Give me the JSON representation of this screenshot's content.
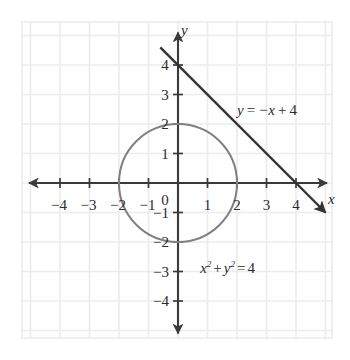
{
  "chart_data": {
    "type": "scatter",
    "title": "",
    "subtitle": "",
    "xlabel": "x",
    "ylabel": "y",
    "xlim": [
      -4.8,
      4.8
    ],
    "ylim": [
      -4.8,
      4.8
    ],
    "grid": true,
    "grid_step": 1,
    "legend_position": "none",
    "x_ticks": [
      -4,
      -3,
      -2,
      -1,
      1,
      2,
      3,
      4
    ],
    "y_ticks": [
      4,
      3,
      2,
      1,
      -1,
      -2,
      -3,
      -4
    ],
    "x_tick_labels": [
      "-4",
      "-3",
      "-2",
      "-1",
      "1",
      "2",
      "3",
      "4"
    ],
    "y_tick_labels": [
      "4",
      "3",
      "2",
      "1",
      "-1",
      "-2",
      "-3",
      "-4"
    ],
    "origin_label": "0",
    "series": [
      {
        "name": "line",
        "type": "line",
        "equation": "y = -x + 4",
        "slope": -1,
        "intercept": 4,
        "x": [
          -0.6,
          5.0
        ],
        "y": [
          4.6,
          -1.0
        ],
        "color": "#333333",
        "arrow_end": true,
        "label": {
          "text_parts": [
            "y",
            "=",
            "−x",
            "+",
            "4"
          ],
          "x": 2.0,
          "y": 2.7
        }
      },
      {
        "name": "circle",
        "type": "circle",
        "equation": "x^2 + y^2 = 4",
        "center": [
          0,
          0
        ],
        "radius": 2,
        "color": "#808080",
        "label": {
          "text_parts": [
            "x",
            "2",
            "+",
            "y",
            "2",
            "=",
            "4"
          ],
          "x": 0.75,
          "y": -2.6
        }
      }
    ],
    "annotations": [
      {
        "name": "line-equation-label",
        "text": "y = −x + 4"
      },
      {
        "name": "circle-equation-label",
        "text": "x² + y² = 4"
      }
    ]
  },
  "axes": {
    "x_axis_label": "x",
    "y_axis_label": "y",
    "origin_label": "0",
    "axis_color": "#3a3a3a",
    "grid_color": "#ececec",
    "tick_labels_x": [
      {
        "value": -4,
        "text": "−4"
      },
      {
        "value": -3,
        "text": "−3"
      },
      {
        "value": -2,
        "text": "−2"
      },
      {
        "value": -1,
        "text": "−1"
      },
      {
        "value": 1,
        "text": "1"
      },
      {
        "value": 2,
        "text": "2"
      },
      {
        "value": 3,
        "text": "3"
      },
      {
        "value": 4,
        "text": "4"
      }
    ],
    "tick_labels_y": [
      {
        "value": 4,
        "text": "4"
      },
      {
        "value": 3,
        "text": "3"
      },
      {
        "value": 2,
        "text": "2"
      },
      {
        "value": 1,
        "text": "1"
      },
      {
        "value": -1,
        "text": "−1"
      },
      {
        "value": -2,
        "text": "−2"
      },
      {
        "value": -3,
        "text": "−3"
      },
      {
        "value": -4,
        "text": "−4"
      }
    ]
  },
  "equations": {
    "line": {
      "lhs": "y",
      "eq": "=",
      "rhs_term1": "−x",
      "plus": "+",
      "rhs_term2": "4"
    },
    "circle": {
      "x_base": "x",
      "x_exp": "2",
      "plus": "+",
      "y_base": "y",
      "y_exp": "2",
      "eq": "=",
      "rhs": "4"
    }
  },
  "colors": {
    "background": "#ffffff",
    "grid": "#ececec",
    "axis": "#3a3a3a",
    "line_curve": "#333333",
    "circle_curve": "#808080",
    "text": "#2b2b2b"
  }
}
